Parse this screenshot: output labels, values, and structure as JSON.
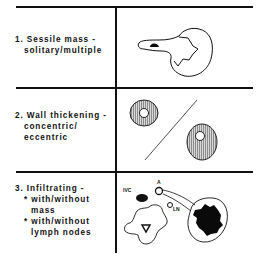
{
  "rows": [
    {
      "number": "1.",
      "title": "Sessile mass -",
      "lines": [
        "solitary/multiple"
      ],
      "figure": "sessile-mass-on-bladder-wall"
    },
    {
      "number": "2.",
      "title": "Wall thickening -",
      "lines": [
        "concentric/",
        "eccentric"
      ],
      "figure": "concentric-and-eccentric-wall-thickening"
    },
    {
      "number": "3.",
      "title": "Infiltrating -",
      "bullets": [
        "* with/without",
        "mass",
        "* with/without",
        "lymph nodes"
      ],
      "figure": "infiltrating-mass-cross-section",
      "figure_labels": {
        "ivc": "IVC",
        "aorta": "A",
        "lymph_node": "LN"
      }
    }
  ],
  "colors": {
    "line": "#111111",
    "fill_dark": "#0a0a0a",
    "hatch": "#9a9a9a",
    "background": "#ffffff"
  }
}
